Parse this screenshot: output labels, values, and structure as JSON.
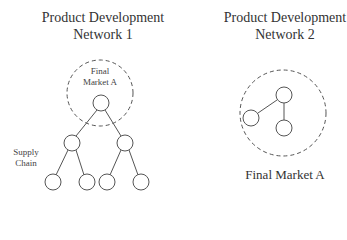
{
  "network1": {
    "title_line1": "Product Development",
    "title_line2": "Network 1",
    "market_label_line1": "Final",
    "market_label_line2": "Market A",
    "side_label_line1": "Supply",
    "side_label_line2": "Chain",
    "nodes": [
      {
        "id": "root",
        "x": 101,
        "y": 103
      },
      {
        "id": "mid-left",
        "x": 72,
        "y": 143
      },
      {
        "id": "mid-right",
        "x": 125,
        "y": 143
      },
      {
        "id": "leaf-1",
        "x": 53,
        "y": 182
      },
      {
        "id": "leaf-2",
        "x": 87,
        "y": 182
      },
      {
        "id": "leaf-3",
        "x": 107,
        "y": 182
      },
      {
        "id": "leaf-4",
        "x": 141,
        "y": 182
      }
    ]
  },
  "network2": {
    "title_line1": "Product Development",
    "title_line2": "Network 2",
    "market_label": "Final Market A",
    "nodes": [
      {
        "id": "top",
        "x": 284,
        "y": 95
      },
      {
        "id": "left",
        "x": 251,
        "y": 118
      },
      {
        "id": "bottom",
        "x": 284,
        "y": 128
      }
    ]
  },
  "colors": {
    "line": "#555555",
    "dashed": "#555555",
    "text": "#333333"
  }
}
